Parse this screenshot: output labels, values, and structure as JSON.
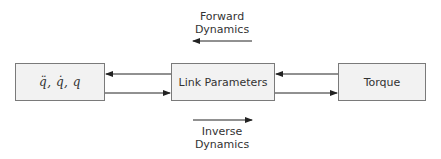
{
  "diagram": {
    "nodes": [
      {
        "id": "kinematics",
        "label": "q̈, q̇, q"
      },
      {
        "id": "link_parameters",
        "label": "Link Parameters"
      },
      {
        "id": "torque",
        "label": "Torque"
      }
    ],
    "annotations": {
      "forward": {
        "line1": "Forward",
        "line2": "Dynamics",
        "direction": "left"
      },
      "inverse": {
        "line1": "Inverse",
        "line2": "Dynamics",
        "direction": "right"
      }
    },
    "edges": [
      {
        "from": "link_parameters",
        "to": "kinematics",
        "direction": "left"
      },
      {
        "from": "kinematics",
        "to": "link_parameters",
        "direction": "right"
      },
      {
        "from": "torque",
        "to": "link_parameters",
        "direction": "left"
      },
      {
        "from": "link_parameters",
        "to": "torque",
        "direction": "right"
      }
    ],
    "colors": {
      "box_fill": "#f2f2f2",
      "box_border": "#7a7a7a",
      "line": "#222222",
      "text": "#333333"
    }
  }
}
